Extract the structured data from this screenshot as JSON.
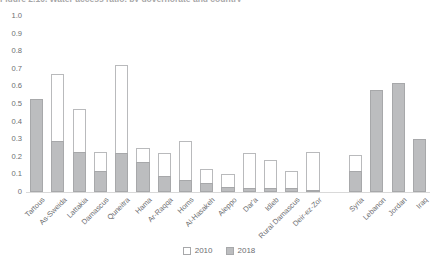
{
  "figure": {
    "title_clipped": "Figure 2.10.  Water access ratio, by governorate and country"
  },
  "legend": {
    "position": "bottom-center",
    "items": [
      {
        "label": "2010",
        "swatch": "white-outline",
        "color": "#ffffff"
      },
      {
        "label": "2018",
        "swatch": "gray-filled",
        "color": "#bcbdbf"
      }
    ]
  },
  "colors": {
    "bar_2010_fill": "#ffffff",
    "bar_2010_stroke": "#b9babc",
    "bar_2018_fill": "#bcbdbf",
    "bar_2018_stroke": "#a7a8aa",
    "axis_text": "#6d6e71",
    "baseline": "#d9d9d9"
  },
  "chart_data": {
    "type": "bar",
    "title": "Figure 2.10.  Water access ratio, by governorate and country",
    "xlabel": "",
    "ylabel": "",
    "ylim": [
      0,
      1.0
    ],
    "yticks": [
      "0",
      "0.1",
      "0.2",
      "0.3",
      "0.4",
      "0.5",
      "0.6",
      "0.7",
      "0.8",
      "0.9",
      "1.0"
    ],
    "ytick_values": [
      0,
      0.1,
      0.2,
      0.3,
      0.4,
      0.5,
      0.6,
      0.7,
      0.8,
      0.9,
      1.0
    ],
    "grid": false,
    "overlaid": true,
    "categories": [
      "Tartous",
      "As-Sweida",
      "Lattakia",
      "Damascus",
      "Quneitra",
      "Hama",
      "Ar-Raqqa",
      "Homs",
      "Al-Hasakeh",
      "Aleppo",
      "Dar'a",
      "Idleb",
      "Rural Damascus",
      "Deir-ez-Zor",
      "",
      "Syria",
      "Lebanon",
      "Jordan",
      "Iraq"
    ],
    "series": [
      {
        "name": "2010",
        "values": [
          0.53,
          0.67,
          0.47,
          0.23,
          0.72,
          0.25,
          0.22,
          0.29,
          0.13,
          0.1,
          0.22,
          0.18,
          0.12,
          0.23,
          null,
          0.21,
          null,
          null,
          null
        ]
      },
      {
        "name": "2018",
        "values": [
          0.53,
          0.29,
          0.23,
          0.12,
          0.22,
          0.17,
          0.09,
          0.07,
          0.05,
          0.03,
          0.02,
          0.02,
          0.02,
          0.01,
          null,
          0.12,
          0.58,
          0.62,
          0.3
        ]
      }
    ]
  }
}
